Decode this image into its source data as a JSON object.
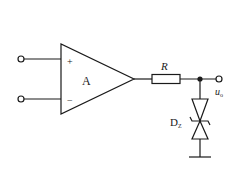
{
  "diagram": {
    "type": "circuit",
    "title": "",
    "colors": {
      "stroke": "#1a1a1a",
      "background": "#ffffff"
    },
    "opamp": {
      "label": "A",
      "plus": "+",
      "minus": "−"
    },
    "resistor": {
      "label": "R"
    },
    "zener": {
      "label_main": "D",
      "label_sub": "Z"
    },
    "output": {
      "label_main": "u",
      "label_sub": "o"
    },
    "terminals": [
      "input-noninverting",
      "input-inverting",
      "output"
    ]
  }
}
